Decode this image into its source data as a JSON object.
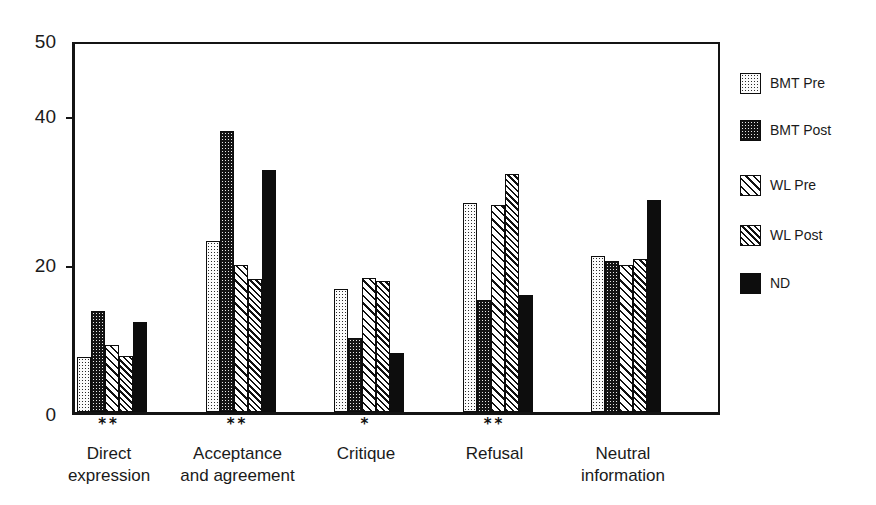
{
  "chart_data": {
    "type": "bar",
    "title": "",
    "subtitle": "",
    "xlabel": "",
    "ylabel": "",
    "ylim": [
      0,
      50
    ],
    "ytick_labels": [
      "0",
      "20",
      "40",
      "50"
    ],
    "ytick_values": [
      0,
      20,
      40,
      50
    ],
    "grid": false,
    "legend_position": "right",
    "categories": [
      "Direct expression",
      "Acceptance and agreement",
      "Critique",
      "Refusal",
      "Neutral information"
    ],
    "category_lines": [
      [
        "Direct",
        "expression"
      ],
      [
        "Acceptance",
        "and agreement"
      ],
      [
        "Critique",
        ""
      ],
      [
        "Refusal",
        ""
      ],
      [
        "Neutral",
        "information"
      ]
    ],
    "significance_markers": [
      "**",
      "**",
      "*",
      "**",
      ""
    ],
    "series": [
      {
        "name": "BMT Pre",
        "pattern": "light-dot-grid",
        "values": [
          7.4,
          22.9,
          16.5,
          28.0,
          20.9
        ]
      },
      {
        "name": "BMT Post",
        "pattern": "dense-dot-dark",
        "values": [
          13.5,
          37.7,
          9.9,
          15.0,
          20.2
        ]
      },
      {
        "name": "WL Pre",
        "pattern": "diagonal-hatch",
        "values": [
          9.0,
          19.7,
          18.0,
          27.7,
          19.7
        ]
      },
      {
        "name": "WL Post",
        "pattern": "dense-diagonal",
        "values": [
          7.5,
          17.8,
          17.6,
          31.9,
          20.5
        ]
      },
      {
        "name": "ND",
        "pattern": "solid-black",
        "values": [
          12.1,
          32.4,
          7.9,
          15.7,
          28.4
        ]
      }
    ]
  },
  "legend": {
    "items": [
      {
        "label": "BMT Pre"
      },
      {
        "label": "BMT Post"
      },
      {
        "label": "WL Pre"
      },
      {
        "label": "WL Post"
      },
      {
        "label": "ND"
      }
    ]
  },
  "colors": {
    "ink": "#141414",
    "background": "#ffffff",
    "solid_series": "#0d0d0d"
  }
}
